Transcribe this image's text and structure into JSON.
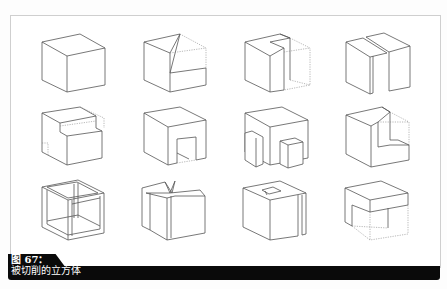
{
  "figure": {
    "label": "图 67：",
    "caption": "被切削的立方体"
  },
  "cubes": [
    {
      "row": 1,
      "col": 1,
      "description": "solid cube"
    },
    {
      "row": 1,
      "col": 2,
      "description": "cube with diagonal wedge cut from top"
    },
    {
      "row": 1,
      "col": 3,
      "description": "cube with L-shaped notch removed"
    },
    {
      "row": 1,
      "col": 4,
      "description": "cube split by vertical slot"
    },
    {
      "row": 2,
      "col": 1,
      "description": "cube with top step cut"
    },
    {
      "row": 2,
      "col": 2,
      "description": "cube with arch opening"
    },
    {
      "row": 2,
      "col": 3,
      "description": "cube with protruding blocks"
    },
    {
      "row": 2,
      "col": 4,
      "description": "cube with corner notch"
    },
    {
      "row": 3,
      "col": 1,
      "description": "wireframe frame cube"
    },
    {
      "row": 3,
      "col": 2,
      "description": "cube with folded top flaps"
    },
    {
      "row": 3,
      "col": 3,
      "description": "cube with hollow core and side slot"
    },
    {
      "row": 3,
      "col": 4,
      "description": "cube with lower portion removed"
    }
  ],
  "colors": {
    "caption_bg": "#0a0a0a",
    "caption_text": "#ffffff",
    "line": "#555555",
    "frame": "#cfcfcf"
  }
}
